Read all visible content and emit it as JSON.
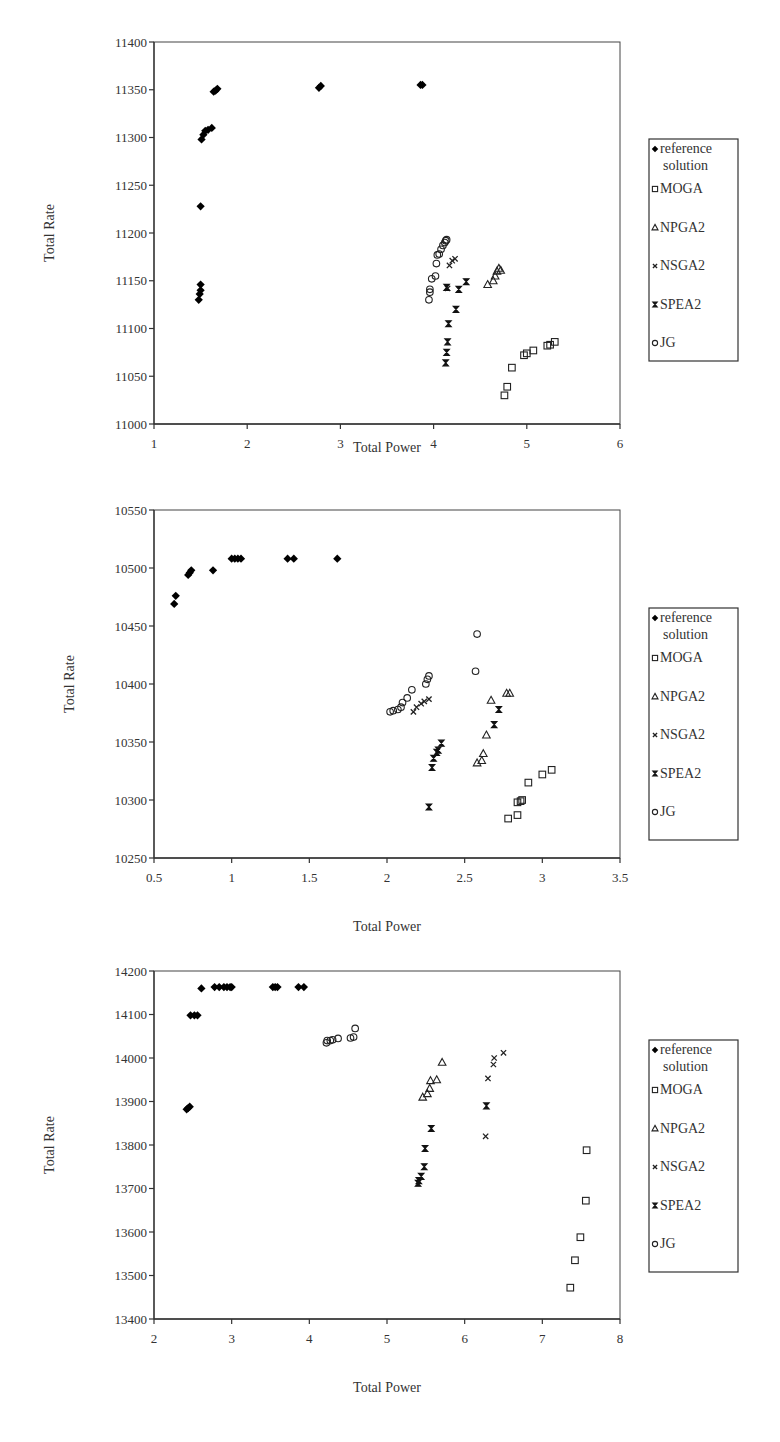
{
  "legend": [
    {
      "key": "ref",
      "label_lines": [
        "reference",
        "solution"
      ],
      "marker": "diamond-filled"
    },
    {
      "key": "moga",
      "label_lines": [
        "MOGA"
      ],
      "marker": "square-open"
    },
    {
      "key": "npga2",
      "label_lines": [
        "NPGA2"
      ],
      "marker": "triangle-open"
    },
    {
      "key": "nsga2",
      "label_lines": [
        "NSGA2"
      ],
      "marker": "x-cross"
    },
    {
      "key": "spea2",
      "label_lines": [
        "SPEA2"
      ],
      "marker": "hourglass-star"
    },
    {
      "key": "jg",
      "label_lines": [
        "JG"
      ],
      "marker": "circle-open"
    }
  ],
  "chart_data": [
    {
      "type": "scatter",
      "title": "",
      "xlabel": "Total Power",
      "ylabel": "Total Rate",
      "xlim": [
        1,
        6
      ],
      "ylim": [
        11000,
        11400
      ],
      "xticks": [
        1,
        2,
        3,
        4,
        5,
        6
      ],
      "yticks": [
        11000,
        11050,
        11100,
        11150,
        11200,
        11250,
        11300,
        11350,
        11400
      ],
      "grid": false,
      "legend_position": "right",
      "series": [
        {
          "name": "reference solution",
          "key": "ref",
          "points": [
            [
              1.48,
              11130
            ],
            [
              1.49,
              11136
            ],
            [
              1.5,
              11140
            ],
            [
              1.5,
              11146
            ],
            [
              1.5,
              11228
            ],
            [
              1.51,
              11298
            ],
            [
              1.53,
              11303
            ],
            [
              1.55,
              11307
            ],
            [
              1.58,
              11308
            ],
            [
              1.62,
              11310
            ],
            [
              1.64,
              11348
            ],
            [
              1.66,
              11349
            ],
            [
              1.68,
              11351
            ],
            [
              2.77,
              11352
            ],
            [
              2.79,
              11354
            ],
            [
              3.86,
              11355
            ],
            [
              3.88,
              11355
            ]
          ]
        },
        {
          "name": "MOGA",
          "key": "moga",
          "points": [
            [
              4.76,
              11030
            ],
            [
              4.79,
              11039
            ],
            [
              4.84,
              11059
            ],
            [
              4.97,
              11072
            ],
            [
              5.0,
              11074
            ],
            [
              5.07,
              11077
            ],
            [
              5.22,
              11082
            ],
            [
              5.25,
              11083
            ],
            [
              5.3,
              11086
            ]
          ]
        },
        {
          "name": "NPGA2",
          "key": "npga2",
          "points": [
            [
              4.58,
              11146
            ],
            [
              4.64,
              11150
            ],
            [
              4.66,
              11155
            ],
            [
              4.68,
              11160
            ],
            [
              4.7,
              11163
            ],
            [
              4.72,
              11161
            ]
          ]
        },
        {
          "name": "NSGA2",
          "key": "nsga2",
          "points": [
            [
              4.15,
              11142
            ],
            [
              4.17,
              11166
            ],
            [
              4.2,
              11171
            ],
            [
              4.23,
              11173
            ]
          ]
        },
        {
          "name": "SPEA2",
          "key": "spea2",
          "points": [
            [
              4.13,
              11064
            ],
            [
              4.14,
              11075
            ],
            [
              4.15,
              11086
            ],
            [
              4.16,
              11105
            ],
            [
              4.24,
              11120
            ],
            [
              4.27,
              11141
            ],
            [
              4.35,
              11149
            ],
            [
              4.14,
              11143
            ]
          ]
        },
        {
          "name": "JG",
          "key": "jg",
          "points": [
            [
              3.95,
              11130
            ],
            [
              3.96,
              11138
            ],
            [
              3.96,
              11141
            ],
            [
              3.98,
              11152
            ],
            [
              4.02,
              11155
            ],
            [
              4.03,
              11168
            ],
            [
              4.04,
              11177
            ],
            [
              4.06,
              11178
            ],
            [
              4.08,
              11183
            ],
            [
              4.1,
              11187
            ],
            [
              4.12,
              11190
            ],
            [
              4.13,
              11192
            ],
            [
              4.14,
              11193
            ]
          ]
        }
      ]
    },
    {
      "type": "scatter",
      "title": "",
      "xlabel": "Total Power",
      "ylabel": "Total Rate",
      "xlim": [
        0.5,
        3.5
      ],
      "ylim": [
        10250,
        10550
      ],
      "xticks": [
        0.5,
        1,
        1.5,
        2,
        2.5,
        3,
        3.5
      ],
      "yticks": [
        10250,
        10300,
        10350,
        10400,
        10450,
        10500,
        10550
      ],
      "grid": false,
      "legend_position": "right",
      "series": [
        {
          "name": "reference solution",
          "key": "ref",
          "points": [
            [
              0.63,
              10469
            ],
            [
              0.64,
              10476
            ],
            [
              0.72,
              10494
            ],
            [
              0.73,
              10496
            ],
            [
              0.74,
              10498
            ],
            [
              0.88,
              10498
            ],
            [
              1.0,
              10508
            ],
            [
              1.02,
              10508
            ],
            [
              1.04,
              10508
            ],
            [
              1.06,
              10508
            ],
            [
              1.36,
              10508
            ],
            [
              1.4,
              10508
            ],
            [
              1.68,
              10508
            ]
          ]
        },
        {
          "name": "MOGA",
          "key": "moga",
          "points": [
            [
              2.78,
              10284
            ],
            [
              2.84,
              10287
            ],
            [
              2.84,
              10298
            ],
            [
              2.86,
              10299
            ],
            [
              2.87,
              10300
            ],
            [
              2.91,
              10315
            ],
            [
              3.0,
              10322
            ],
            [
              3.06,
              10326
            ]
          ]
        },
        {
          "name": "NPGA2",
          "key": "npga2",
          "points": [
            [
              2.58,
              10332
            ],
            [
              2.61,
              10334
            ],
            [
              2.62,
              10340
            ],
            [
              2.64,
              10356
            ],
            [
              2.67,
              10386
            ],
            [
              2.77,
              10392
            ],
            [
              2.79,
              10392
            ]
          ]
        },
        {
          "name": "NSGA2",
          "key": "nsga2",
          "points": [
            [
              2.17,
              10376
            ],
            [
              2.19,
              10380
            ],
            [
              2.22,
              10383
            ],
            [
              2.24,
              10385
            ],
            [
              2.27,
              10387
            ]
          ]
        },
        {
          "name": "SPEA2",
          "key": "spea2",
          "points": [
            [
              2.27,
              10294
            ],
            [
              2.29,
              10328
            ],
            [
              2.3,
              10336
            ],
            [
              2.32,
              10341
            ],
            [
              2.33,
              10343
            ],
            [
              2.35,
              10349
            ],
            [
              2.69,
              10365
            ],
            [
              2.72,
              10378
            ]
          ]
        },
        {
          "name": "JG",
          "key": "jg",
          "points": [
            [
              2.02,
              10376
            ],
            [
              2.04,
              10377
            ],
            [
              2.07,
              10378
            ],
            [
              2.09,
              10380
            ],
            [
              2.1,
              10384
            ],
            [
              2.13,
              10388
            ],
            [
              2.16,
              10395
            ],
            [
              2.25,
              10400
            ],
            [
              2.26,
              10404
            ],
            [
              2.27,
              10407
            ],
            [
              2.57,
              10411
            ],
            [
              2.58,
              10443
            ]
          ]
        }
      ]
    },
    {
      "type": "scatter",
      "title": "",
      "xlabel": "Total Power",
      "ylabel": "Total Rate",
      "xlim": [
        2,
        8
      ],
      "ylim": [
        13400,
        14200
      ],
      "xticks": [
        2,
        3,
        4,
        5,
        6,
        7,
        8
      ],
      "yticks": [
        13400,
        13500,
        13600,
        13700,
        13800,
        13900,
        14000,
        14100,
        14200
      ],
      "grid": false,
      "legend_position": "right",
      "series": [
        {
          "name": "reference solution",
          "key": "ref",
          "points": [
            [
              2.42,
              13882
            ],
            [
              2.44,
              13885
            ],
            [
              2.46,
              13888
            ],
            [
              2.47,
              14098
            ],
            [
              2.52,
              14098
            ],
            [
              2.56,
              14098
            ],
            [
              2.61,
              14160
            ],
            [
              2.78,
              14163
            ],
            [
              2.84,
              14163
            ],
            [
              2.9,
              14163
            ],
            [
              2.94,
              14163
            ],
            [
              2.98,
              14163
            ],
            [
              3.0,
              14163
            ],
            [
              3.53,
              14163
            ],
            [
              3.56,
              14163
            ],
            [
              3.59,
              14163
            ],
            [
              3.86,
              14163
            ],
            [
              3.93,
              14163
            ]
          ]
        },
        {
          "name": "MOGA",
          "key": "moga",
          "points": [
            [
              7.36,
              13472
            ],
            [
              7.42,
              13535
            ],
            [
              7.49,
              13588
            ],
            [
              7.56,
              13672
            ],
            [
              7.57,
              13788
            ]
          ]
        },
        {
          "name": "NPGA2",
          "key": "npga2",
          "points": [
            [
              5.46,
              13910
            ],
            [
              5.52,
              13918
            ],
            [
              5.55,
              13930
            ],
            [
              5.56,
              13948
            ],
            [
              5.64,
              13950
            ],
            [
              5.71,
              13990
            ]
          ]
        },
        {
          "name": "NSGA2",
          "key": "nsga2",
          "points": [
            [
              6.27,
              13820
            ],
            [
              6.3,
              13953
            ],
            [
              6.37,
              13985
            ],
            [
              6.38,
              14000
            ],
            [
              6.5,
              14012
            ]
          ]
        },
        {
          "name": "SPEA2",
          "key": "spea2",
          "points": [
            [
              5.4,
              13712
            ],
            [
              5.41,
              13718
            ],
            [
              5.44,
              13728
            ],
            [
              5.48,
              13750
            ],
            [
              5.49,
              13792
            ],
            [
              5.57,
              13838
            ],
            [
              6.28,
              13890
            ]
          ]
        },
        {
          "name": "JG",
          "key": "jg",
          "points": [
            [
              4.22,
              14035
            ],
            [
              4.23,
              14040
            ],
            [
              4.27,
              14040
            ],
            [
              4.3,
              14042
            ],
            [
              4.37,
              14045
            ],
            [
              4.53,
              14046
            ],
            [
              4.57,
              14048
            ],
            [
              4.59,
              14068
            ]
          ]
        }
      ]
    }
  ]
}
